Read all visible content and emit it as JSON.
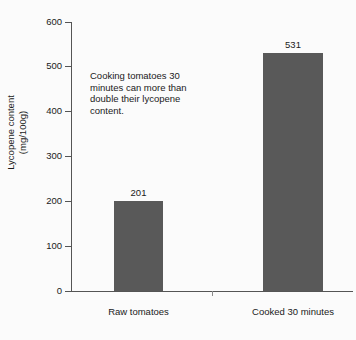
{
  "chart_data": {
    "type": "bar",
    "title": "",
    "subtitle": "",
    "xlabel": "",
    "ylabel": "Lycopene content\n(mg/100g)",
    "categories": [
      "Raw tomatoes",
      "Cooked 30 minutes"
    ],
    "values": [
      201,
      531
    ],
    "value_labels": [
      "201",
      "531"
    ],
    "ylim": [
      0,
      600
    ],
    "yticks": [
      0,
      100,
      200,
      300,
      400,
      500,
      600
    ],
    "ytick_labels": [
      "0",
      "100",
      "200",
      "300",
      "400",
      "500",
      "600"
    ],
    "grid": false,
    "legend": null,
    "legend_position": "none",
    "bar_color": "#595959",
    "axis_color": "#555555",
    "background_color": "#fbfbfb",
    "annotations": [
      {
        "text": "Cooking tomatoes 30\nminutes can more than\ndouble their lycopene\ncontent.",
        "x": 90,
        "y": 70
      }
    ]
  }
}
